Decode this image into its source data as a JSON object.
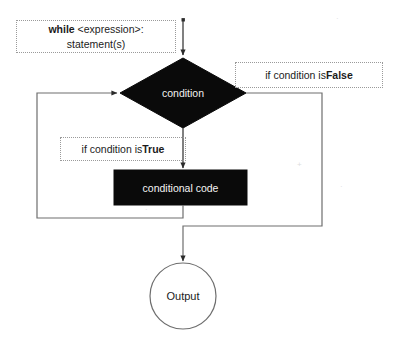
{
  "diagram": {
    "background_color": "#ffffff",
    "shape_fill_color": "#0a0a0a",
    "shape_text_color": "#f2f2f2",
    "line_color": "#5a5a5a",
    "note_border_color": "#9a9a9a",
    "text_color": "#1b1b1b"
  },
  "nodes": {
    "while_note": {
      "line1_prefix": "while",
      "line1_rest": " <expression>:",
      "line2": "statement(s)"
    },
    "condition": {
      "label": "condition",
      "shape": "diamond"
    },
    "conditional_code": {
      "label": "conditional code",
      "shape": "rectangle"
    },
    "output": {
      "label": "Output",
      "shape": "circle"
    }
  },
  "annotations": {
    "false_branch": {
      "prefix": "if condition is ",
      "emphasis": "False"
    },
    "true_branch": {
      "prefix": "if condition is ",
      "emphasis": "True"
    }
  },
  "edges": [
    {
      "name": "start-to-condition",
      "from": "while_note",
      "to": "condition",
      "label": ""
    },
    {
      "name": "condition-to-code",
      "from": "condition",
      "to": "conditional_code",
      "label": "if condition is True"
    },
    {
      "name": "code-loop-back",
      "from": "conditional_code",
      "to": "condition",
      "label": ""
    },
    {
      "name": "condition-to-output",
      "from": "condition",
      "to": "output",
      "label": "if condition is False"
    }
  ]
}
